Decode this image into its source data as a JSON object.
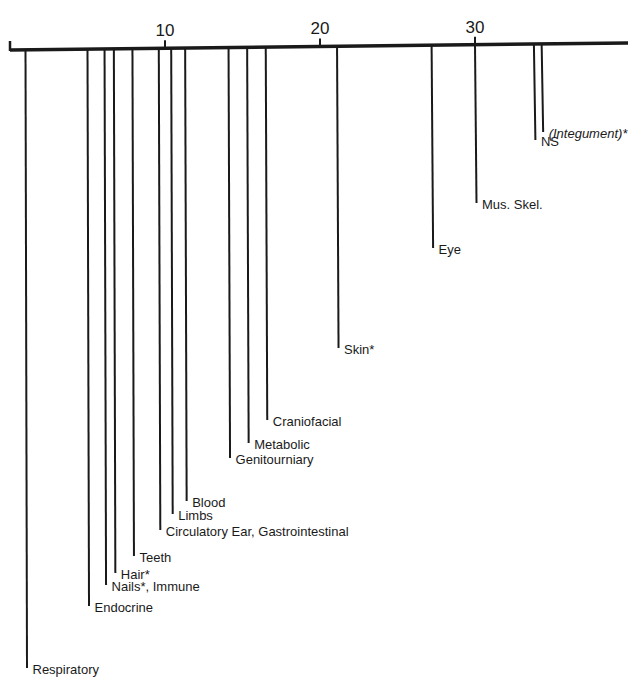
{
  "chart_data": {
    "type": "bar",
    "orientation": "inverted-vertical-lines",
    "title": "",
    "xlabel": "",
    "ylabel": "",
    "xlim": [
      0,
      40
    ],
    "x_ticks": [
      10,
      20,
      30
    ],
    "x_tick_labels": [
      "10",
      "20",
      "30"
    ],
    "grid": false,
    "legend": null,
    "axis_color": "#1a1a1a",
    "points": [
      {
        "label": "Respiratory",
        "value": 1.0,
        "italic": false,
        "line_end_y": 668
      },
      {
        "label": "Endocrine",
        "value": 5.0,
        "italic": false,
        "line_end_y": 606
      },
      {
        "label": "Nails*, Immune",
        "value": 6.1,
        "italic": false,
        "line_end_y": 585
      },
      {
        "label": "Hair*",
        "value": 6.7,
        "italic": false,
        "line_end_y": 573
      },
      {
        "label": "Teeth",
        "value": 7.9,
        "italic": false,
        "line_end_y": 556
      },
      {
        "label": "Circulatory  Ear, Gastrointestinal",
        "value": 9.6,
        "italic": false,
        "line_end_y": 530
      },
      {
        "label": "Limbs",
        "value": 10.4,
        "italic": false,
        "line_end_y": 514
      },
      {
        "label": "Blood",
        "value": 11.3,
        "italic": false,
        "line_end_y": 501
      },
      {
        "label": "Genitourniary",
        "value": 14.1,
        "italic": false,
        "line_end_y": 458
      },
      {
        "label": "Metabolic",
        "value": 15.3,
        "italic": false,
        "line_end_y": 443
      },
      {
        "label": "Craniofacial",
        "value": 16.5,
        "italic": false,
        "line_end_y": 420
      },
      {
        "label": "Skin*",
        "value": 21.1,
        "italic": false,
        "line_end_y": 348
      },
      {
        "label": "Eye",
        "value": 27.2,
        "italic": false,
        "line_end_y": 248
      },
      {
        "label": "Mus. Skel.",
        "value": 30.0,
        "italic": false,
        "line_end_y": 203
      },
      {
        "label": "NS",
        "value": 33.8,
        "italic": false,
        "line_end_y": 140
      },
      {
        "label": "(Integument)*",
        "value": 34.3,
        "italic": true,
        "line_end_y": 132
      }
    ]
  }
}
